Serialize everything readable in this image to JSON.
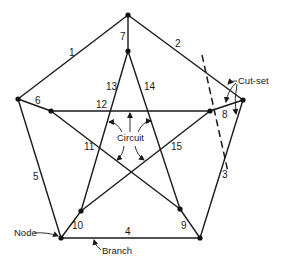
{
  "diagram": {
    "type": "graph",
    "nodes": [
      {
        "id": "outer-top",
        "x": 128,
        "y": 15
      },
      {
        "id": "outer-left",
        "x": 18,
        "y": 99
      },
      {
        "id": "outer-right",
        "x": 243,
        "y": 100
      },
      {
        "id": "outer-bottom-left",
        "x": 61,
        "y": 238
      },
      {
        "id": "outer-bottom-right",
        "x": 200,
        "y": 238
      },
      {
        "id": "inner-top",
        "x": 128,
        "y": 51
      },
      {
        "id": "inner-left",
        "x": 51,
        "y": 111
      },
      {
        "id": "inner-right",
        "x": 210,
        "y": 111
      },
      {
        "id": "inner-bottom-left",
        "x": 81,
        "y": 211
      },
      {
        "id": "inner-bottom-right",
        "x": 180,
        "y": 209
      }
    ],
    "edges": [
      {
        "label": "1",
        "from": "outer-top",
        "to": "outer-left"
      },
      {
        "label": "2",
        "from": "outer-top",
        "to": "outer-right"
      },
      {
        "label": "3",
        "from": "outer-right",
        "to": "outer-bottom-right"
      },
      {
        "label": "4",
        "from": "outer-bottom-left",
        "to": "outer-bottom-right"
      },
      {
        "label": "5",
        "from": "outer-left",
        "to": "outer-bottom-left"
      },
      {
        "label": "6",
        "from": "outer-left",
        "to": "inner-left"
      },
      {
        "label": "7",
        "from": "outer-top",
        "to": "inner-top"
      },
      {
        "label": "8",
        "from": "outer-right",
        "to": "inner-right"
      },
      {
        "label": "9",
        "from": "outer-bottom-right",
        "to": "inner-bottom-right"
      },
      {
        "label": "10",
        "from": "outer-bottom-left",
        "to": "inner-bottom-left"
      },
      {
        "label": "11",
        "from": "inner-left",
        "to": "inner-bottom-right"
      },
      {
        "label": "12",
        "from": "inner-left",
        "to": "inner-right"
      },
      {
        "label": "13",
        "from": "inner-top",
        "to": "inner-bottom-left"
      },
      {
        "label": "14",
        "from": "inner-top",
        "to": "inner-bottom-right"
      },
      {
        "label": "15",
        "from": "inner-right",
        "to": "inner-bottom-left"
      }
    ],
    "annotations": {
      "node": "Node",
      "branch": "Branch",
      "circuit": "Circuit",
      "cut_set": "Cut-set"
    }
  }
}
